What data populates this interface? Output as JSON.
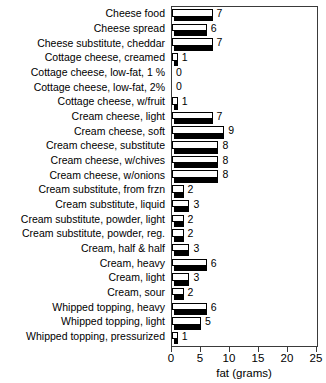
{
  "chart_data": {
    "type": "bar",
    "orientation": "horizontal",
    "title": "",
    "xlabel": "fat (grams)",
    "ylabel": "",
    "xlim": [
      0,
      25
    ],
    "xticks": [
      0,
      5,
      10,
      15,
      20,
      25
    ],
    "xticklabels": [
      "0",
      "5",
      "10",
      "15",
      "20",
      "25"
    ],
    "grid": false,
    "legend": null,
    "categories": [
      "Cheese food",
      "Cheese spread",
      "Cheese substitute, cheddar",
      "Cottage cheese, creamed",
      "Cottage cheese, low-fat, 1 %",
      "Cottage cheese, low-fat, 2%",
      "Cottage cheese, w/fruit",
      "Cream cheese, light",
      "Cream cheese, soft",
      "Cream cheese, substitute",
      "Cream cheese, w/chives",
      "Cream cheese, w/onions",
      "Cream substitute, from frzn",
      "Cream substitute, liquid",
      "Cream substitute, powder, light",
      "Cream substitute, powder, reg.",
      "Cream, half & half",
      "Cream, heavy",
      "Cream, light",
      "Cream, sour",
      "Whipped topping, heavy",
      "Whipped topping, light",
      "Whipped topping, pressurized"
    ],
    "values": [
      7,
      6,
      7,
      1,
      0,
      0,
      1,
      7,
      9,
      8,
      8,
      8,
      2,
      3,
      2,
      2,
      3,
      6,
      3,
      2,
      6,
      5,
      1
    ],
    "value_labels": [
      "7",
      "6",
      "7",
      "1",
      "0",
      "0",
      "1",
      "7",
      "9",
      "8",
      "8",
      "8",
      "2",
      "3",
      "2",
      "2",
      "3",
      "6",
      "3",
      "2",
      "6",
      "5",
      "1"
    ]
  },
  "style": {
    "bar_face_color": "#ffffff",
    "bar_edge_color": "#000000",
    "bar_shadow_color": "#000000",
    "axis_color": "#3a3a3a",
    "text_color": "#000000",
    "background_color": "#ffffff"
  }
}
